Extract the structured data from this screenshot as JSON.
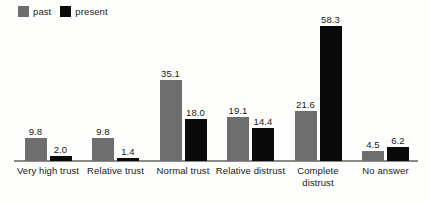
{
  "legend": {
    "entries": [
      {
        "label": "past",
        "color": "#6e6e6e",
        "swatch_name": "legend-swatch-past"
      },
      {
        "label": "present",
        "color": "#0a0a0a",
        "swatch_name": "legend-swatch-present"
      }
    ]
  },
  "chart_data": {
    "type": "bar",
    "title": "",
    "subtitle": "",
    "xlabel": "",
    "ylabel": "",
    "ylim": [
      0,
      58.3
    ],
    "grid": false,
    "legend_position": "top-left",
    "orientation": "vertical",
    "grouping": "grouped",
    "value_label_format": "one-decimal",
    "categories": [
      "Very high trust",
      "Relative trust",
      "Normal trust",
      "Relative distrust",
      "Complete\ndistrust",
      "No answer"
    ],
    "series": [
      {
        "name": "past",
        "color": "#6e6e6e",
        "values": [
          9.8,
          9.8,
          35.1,
          19.1,
          21.6,
          4.5
        ],
        "labels": [
          "9.8",
          "9.8",
          "35.1",
          "19.1",
          "21.6",
          "4.5"
        ]
      },
      {
        "name": "present",
        "color": "#0a0a0a",
        "values": [
          2.0,
          1.4,
          18.0,
          14.4,
          58.3,
          6.2
        ],
        "labels": [
          "2.0",
          "1.4",
          "18.0",
          "14.4",
          "58.3",
          "6.2"
        ]
      }
    ]
  },
  "axis": {
    "baseline_color": "#8a8a88"
  }
}
